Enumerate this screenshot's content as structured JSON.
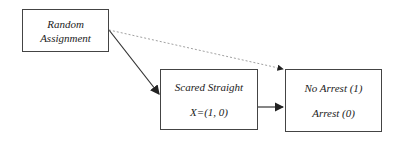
{
  "diagram": {
    "nodes": [
      {
        "id": "random",
        "lines": [
          "Random",
          "Assignment"
        ]
      },
      {
        "id": "treatment",
        "lines": [
          "Scared Straight",
          "X=(1, 0)"
        ]
      },
      {
        "id": "outcome",
        "lines": [
          "No Arrest (1)",
          "Arrest (0)"
        ]
      }
    ],
    "edges": [
      {
        "from": "random",
        "to": "treatment",
        "style": "solid"
      },
      {
        "from": "random",
        "to": "outcome",
        "style": "dashed"
      },
      {
        "from": "treatment",
        "to": "outcome",
        "style": "solid"
      }
    ]
  }
}
